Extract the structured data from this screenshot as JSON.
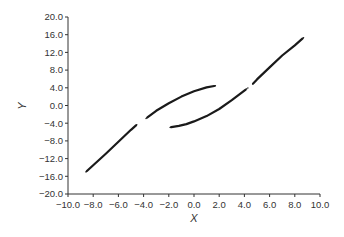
{
  "chart_data": {
    "type": "scatter",
    "title": "",
    "xlabel": "X",
    "ylabel": "Y",
    "xlim": [
      -10.0,
      10.0
    ],
    "ylim": [
      -20.0,
      20.0
    ],
    "grid": false,
    "legend": null,
    "x_ticks": [
      "-10.0",
      "-8.0",
      "-6.0",
      "-4.0",
      "-2.0",
      "0.0",
      "2.0",
      "4.0",
      "6.0",
      "8.0",
      "10.0"
    ],
    "y_ticks": [
      "20.0",
      "16.0",
      "12.0",
      "8.0",
      "4.0",
      "0.0",
      "-4.0",
      "-8.0",
      "-12.0",
      "-16.0",
      "-20.0"
    ],
    "series": [
      {
        "name": "branch-1",
        "segments": [
          {
            "x": [
              -8.5,
              -8.0,
              -7.0,
              -6.0,
              -5.0,
              -4.6
            ],
            "y": [
              -14.8,
              -13.5,
              -10.9,
              -8.2,
              -5.5,
              -4.5
            ]
          },
          {
            "x": [
              -3.7,
              -3.0,
              -2.0,
              -1.0,
              0.0,
              1.0,
              1.6
            ],
            "y": [
              -2.7,
              -1.2,
              0.5,
              2.0,
              3.2,
              4.1,
              4.4
            ]
          }
        ]
      },
      {
        "name": "branch-2",
        "segments": [
          {
            "x": [
              -1.8,
              -1.2,
              -0.6,
              0.0,
              1.0,
              2.0,
              3.0,
              4.1
            ],
            "y": [
              -4.9,
              -4.6,
              -4.2,
              -3.6,
              -2.4,
              -0.8,
              1.2,
              3.6
            ]
          },
          {
            "x": [
              4.7,
              5.0,
              6.0,
              7.0,
              8.0,
              8.6
            ],
            "y": [
              5.0,
              5.9,
              8.6,
              11.3,
              13.6,
              15.1
            ]
          }
        ]
      }
    ],
    "colors": {
      "axis": "#333333",
      "series": "#1a1a1a",
      "background": "#ffffff"
    }
  }
}
